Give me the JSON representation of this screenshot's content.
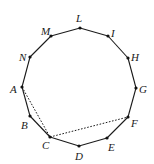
{
  "diagram": {
    "type": "regular-polygon",
    "sides": 12,
    "vertices": [
      {
        "name": "L",
        "x": 80,
        "y": 28,
        "lx": 76,
        "ly": 22
      },
      {
        "name": "I",
        "x": 108,
        "y": 36,
        "lx": 111,
        "ly": 37
      },
      {
        "name": "H",
        "x": 128,
        "y": 58,
        "lx": 131,
        "ly": 61
      },
      {
        "name": "G",
        "x": 136,
        "y": 88,
        "lx": 139,
        "ly": 93
      },
      {
        "name": "F",
        "x": 128,
        "y": 117,
        "lx": 131,
        "ly": 127
      },
      {
        "name": "E",
        "x": 107,
        "y": 138,
        "lx": 108,
        "ly": 151
      },
      {
        "name": "D",
        "x": 79,
        "y": 146,
        "lx": 75,
        "ly": 160
      },
      {
        "name": "C",
        "x": 50,
        "y": 137,
        "lx": 42,
        "ly": 149
      },
      {
        "name": "B",
        "x": 30,
        "y": 116,
        "lx": 21,
        "ly": 129
      },
      {
        "name": "A",
        "x": 22,
        "y": 87,
        "lx": 10,
        "ly": 93
      },
      {
        "name": "N",
        "x": 30,
        "y": 57,
        "lx": 19,
        "ly": 61
      },
      {
        "name": "M",
        "x": 51,
        "y": 36,
        "lx": 41,
        "ly": 35
      }
    ],
    "dashed_segments": [
      {
        "from": "A",
        "to": "C"
      },
      {
        "from": "C",
        "to": "F"
      }
    ]
  }
}
